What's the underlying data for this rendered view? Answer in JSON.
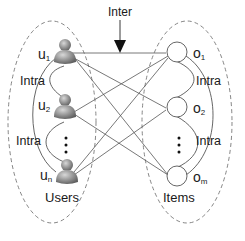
{
  "inter_label": "Inter",
  "groups": {
    "users": {
      "label": "Users"
    },
    "items": {
      "label": "Items"
    }
  },
  "intra_labels": {
    "users_top": "Intra",
    "users_bottom": "Intra",
    "items_top": "Intra",
    "items_bottom": "Intra"
  },
  "users": [
    {
      "id": "u1",
      "base": "u",
      "sub": "1"
    },
    {
      "id": "u2",
      "base": "u",
      "sub": "2"
    },
    {
      "id": "un",
      "base": "u",
      "sub": "n"
    }
  ],
  "items": [
    {
      "id": "o1",
      "base": "o",
      "sub": "1"
    },
    {
      "id": "o2",
      "base": "o",
      "sub": "2"
    },
    {
      "id": "om",
      "base": "o",
      "sub": "m"
    }
  ],
  "ellipsis": "⋮",
  "colors": {
    "line": "#555555",
    "dashed": "#777777",
    "user_icon": "#8a8a8a",
    "text": "#1a1a1a"
  }
}
